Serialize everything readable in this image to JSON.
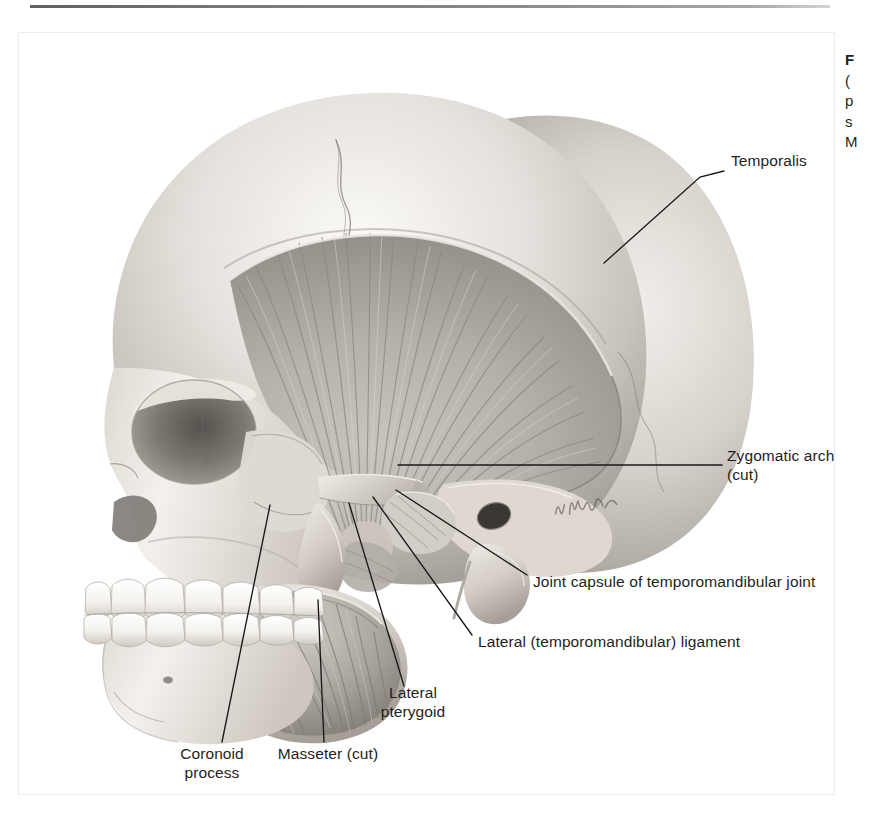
{
  "page": {
    "background_color": "#ffffff",
    "top_rule_color": "#4a4a4a",
    "frame_border_color": "#ececec"
  },
  "figure": {
    "kind": "anatomical-illustration",
    "style": "grayscale pencil / airbrush medical illustration",
    "artist_signature": "K. Wesker",
    "bone_light": "#f3f1ee",
    "bone_mid": "#cfcac4",
    "bone_shadow": "#8e8a85",
    "muscle_light": "#d8d4cf",
    "muscle_mid": "#a9a49e",
    "muscle_dark": "#6f6b66",
    "leader_color": "#1a1a1a"
  },
  "labels": [
    {
      "id": "temporalis",
      "name": "Temporalis",
      "lines": [
        "Temporalis"
      ],
      "align": "left",
      "x": 731,
      "y": 160,
      "leader": [
        [
          724,
          171
        ],
        [
          700,
          177
        ],
        [
          604,
          263
        ]
      ]
    },
    {
      "id": "zygomatic-arch",
      "name": "Zygomatic arch (cut)",
      "lines": [
        "Zygomatic arch",
        "(cut)"
      ],
      "align": "left",
      "x": 727,
      "y": 455,
      "leader": [
        [
          722,
          465
        ],
        [
          398,
          465
        ]
      ]
    },
    {
      "id": "joint-capsule",
      "name": "Joint capsule of temporomandibular joint",
      "lines": [
        "Joint capsule of temporomandibular joint"
      ],
      "align": "left",
      "x": 533,
      "y": 581,
      "leader": [
        [
          527,
          575
        ],
        [
          396,
          490
        ]
      ]
    },
    {
      "id": "lateral-ligament",
      "name": "Lateral (temporomandibular) ligament",
      "lines": [
        "Lateral (temporomandibular) ligament"
      ],
      "align": "left",
      "x": 478,
      "y": 641,
      "leader": [
        [
          472,
          635
        ],
        [
          373,
          497
        ]
      ]
    },
    {
      "id": "lateral-pterygoid",
      "name": "Lateral pterygoid",
      "lines": [
        "Lateral",
        "pterygoid"
      ],
      "align": "center",
      "x": 413,
      "y": 692,
      "leader": [
        [
          404,
          686
        ],
        [
          349,
          503
        ]
      ]
    },
    {
      "id": "coronoid-process",
      "name": "Coronoid process",
      "lines": [
        "Coronoid",
        "process"
      ],
      "align": "center",
      "x": 212,
      "y": 753,
      "leader": [
        [
          222,
          742
        ],
        [
          270,
          505
        ]
      ]
    },
    {
      "id": "masseter",
      "name": "Masseter (cut)",
      "lines": [
        "Masseter (cut)"
      ],
      "align": "center",
      "x": 326,
      "y": 753,
      "leader": [
        [
          324,
          742
        ],
        [
          318,
          600
        ]
      ]
    }
  ],
  "caption_column": {
    "truncated": true,
    "visible_fragments": [
      "F",
      "(",
      "p",
      "s",
      "M"
    ]
  }
}
